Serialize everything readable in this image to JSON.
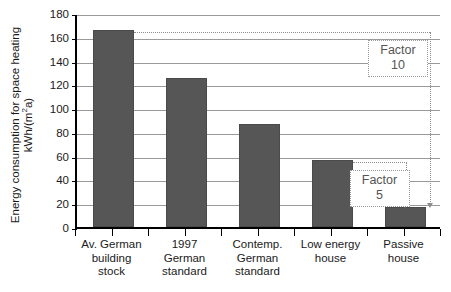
{
  "chart_data": {
    "type": "bar",
    "title": "",
    "xlabel": "",
    "ylabel_line1": "Energy consumption for space heating",
    "ylabel_line2_pre": "kWh/(m",
    "ylabel_line2_sup": "2",
    "ylabel_line2_post": "a)",
    "categories": [
      "Av. German building stock",
      "1997 German standard",
      "Contemp. German standard",
      "Low energy house",
      "Passive house"
    ],
    "category_lines": [
      [
        "Av. German",
        "building",
        "stock"
      ],
      [
        "1997",
        "German",
        "standard"
      ],
      [
        "Contemp.",
        "German",
        "standard"
      ],
      [
        "Low energy",
        "house"
      ],
      [
        "Passive",
        "house"
      ]
    ],
    "values": [
      166,
      125,
      87,
      56,
      17
    ],
    "ylim": [
      0,
      180
    ],
    "ytick_step": 20,
    "ytick_labels": [
      "0",
      "20",
      "40",
      "60",
      "80",
      "100",
      "120",
      "140",
      "160",
      "180"
    ],
    "grid": true,
    "legend": "none",
    "bar_color": "#565656",
    "annotation_color": "#8d8d8d",
    "annotations": [
      {
        "name": "factor-10",
        "label_top": "Factor",
        "label_bottom": "10",
        "from_value": 166,
        "to_value": 17
      },
      {
        "name": "factor-5",
        "label_top": "Factor",
        "label_bottom": "5",
        "from_value": 56,
        "to_value": 17
      }
    ]
  }
}
